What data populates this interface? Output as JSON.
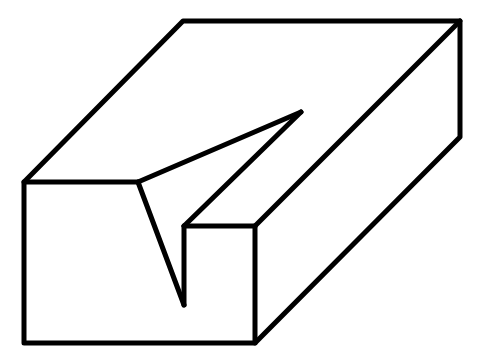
{
  "figure": {
    "stroke_color": "#000000",
    "background": "#ffffff",
    "polylines": [
      {
        "name": "top-back-and-left-edges",
        "points": "24,182 183,21 460,21 460,137 255,343 24,343 24,182"
      },
      {
        "name": "front-top-left-edge",
        "points": "24,182 138,182"
      },
      {
        "name": "notch-left-top-edge",
        "points": "138,182 301,112"
      },
      {
        "name": "notch-front-slant",
        "points": "138,182 184,305"
      },
      {
        "name": "notch-apex-back-edge",
        "points": "301,112 184,226"
      },
      {
        "name": "notch-vertical",
        "points": "184,226 184,305"
      },
      {
        "name": "front-top-right-edge",
        "points": "184,226 255,226"
      },
      {
        "name": "front-right-vertical",
        "points": "255,226 255,343"
      },
      {
        "name": "top-right-diagonal",
        "points": "255,226 460,21"
      }
    ]
  }
}
